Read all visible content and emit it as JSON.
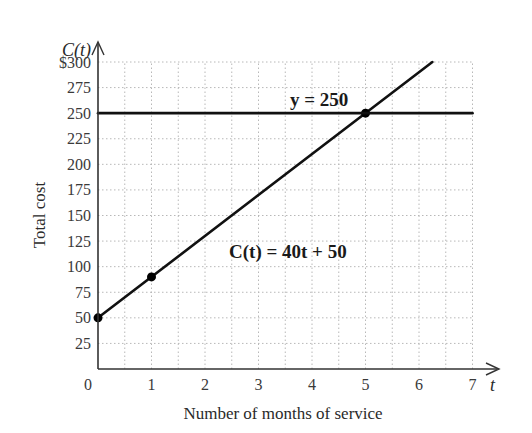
{
  "chart_data": {
    "type": "line",
    "title": "",
    "xlabel": "Number of months of service",
    "ylabel": "Total cost",
    "x_var": "t",
    "y_var": "C(t)",
    "xlim": [
      0,
      7
    ],
    "ylim": [
      0,
      300
    ],
    "x_ticks": [
      "0",
      "1",
      "2",
      "3",
      "4",
      "5",
      "6",
      "7"
    ],
    "y_ticks": [
      "25",
      "50",
      "75",
      "100",
      "125",
      "150",
      "175",
      "200",
      "225",
      "250",
      "275",
      "$300"
    ],
    "grid": true,
    "grid_style": "dotted, half-unit on x, 25 on y",
    "series": [
      {
        "name": "C(t) = 40t + 50",
        "equation": "C(t) = 40t + 50",
        "x": [
          0,
          6.25
        ],
        "y": [
          50,
          300
        ],
        "marked_points": [
          [
            0,
            50
          ],
          [
            1,
            90
          ],
          [
            5,
            250
          ]
        ]
      },
      {
        "name": "y = 250",
        "equation": "y = 250",
        "x": [
          0,
          7
        ],
        "y": [
          250,
          250
        ]
      }
    ],
    "annotations": [
      {
        "text": "y = 250",
        "x": 4.5,
        "y": 262
      },
      {
        "text": "C(t) = 40t + 50",
        "x": 3.4,
        "y": 112
      }
    ]
  },
  "labels": {
    "y_var": "C(t)",
    "x_var": "t",
    "xlabel": "Number of months of service",
    "ylabel": "Total cost",
    "ann_hline": "y = 250",
    "ann_line": "C(t) = 40t + 50"
  }
}
